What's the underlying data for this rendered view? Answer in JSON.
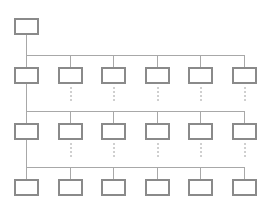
{
  "diagram": {
    "type": "hierarchy-tree",
    "colors": {
      "box_border": "#8a8a8a",
      "box_fill": "#ffffff",
      "line": "#a8a8a8",
      "dashed": "#a0a0a0",
      "background": "#ffffff"
    },
    "root": {
      "label": "",
      "x": 14,
      "y": 18,
      "w": 25,
      "h": 17
    },
    "columns_x": [
      14,
      58,
      101,
      145,
      188,
      232
    ],
    "box_size": {
      "w": 25,
      "h": 17
    },
    "rows": [
      {
        "id": "row-1",
        "box_y": 67,
        "bus_y": 55,
        "nodes": [
          "",
          "",
          "",
          "",
          "",
          ""
        ]
      },
      {
        "id": "row-2",
        "box_y": 123,
        "bus_y": 111,
        "nodes": [
          "",
          "",
          "",
          "",
          "",
          ""
        ]
      },
      {
        "id": "row-3",
        "box_y": 179,
        "bus_y": 167,
        "nodes": [
          "",
          "",
          "",
          "",
          "",
          ""
        ]
      }
    ],
    "dashed_connectors": {
      "columns": [
        1,
        2,
        3,
        4,
        5
      ],
      "after_rows": [
        0,
        1
      ]
    }
  }
}
